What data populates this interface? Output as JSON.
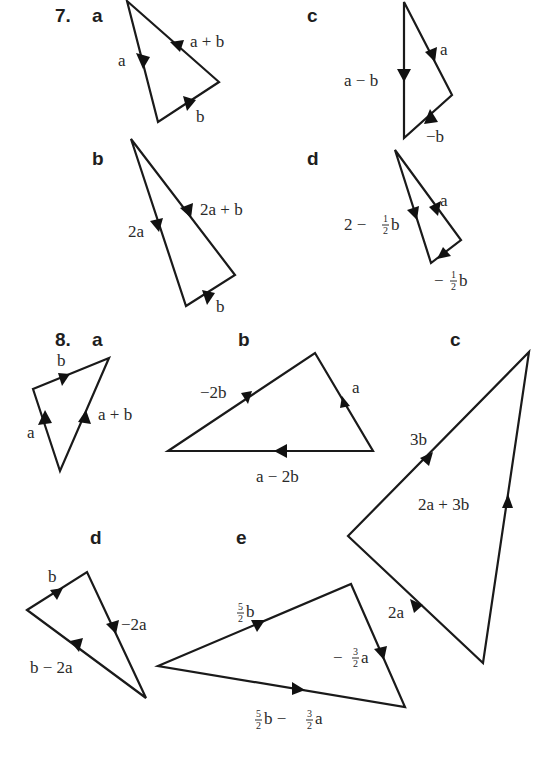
{
  "question7": {
    "number": "7.",
    "parts": {
      "a": {
        "label": "a",
        "edges": [
          "a",
          "a + b",
          "b"
        ]
      },
      "b": {
        "label": "b",
        "edges": [
          "2a",
          "2a + b",
          "b"
        ]
      },
      "c": {
        "label": "c",
        "edges": [
          "a",
          "a − b",
          "−b"
        ]
      },
      "d": {
        "label": "d",
        "edges": [
          "a",
          "2 − ",
          "b",
          "−",
          "b"
        ]
      }
    }
  },
  "question8": {
    "number": "8.",
    "parts": {
      "a": {
        "label": "a",
        "edges": [
          "b",
          "a",
          "a + b"
        ]
      },
      "b": {
        "label": "b",
        "edges": [
          "−2b",
          "a",
          "a − 2b"
        ]
      },
      "c": {
        "label": "c",
        "edges": [
          "3b",
          "2a + 3b",
          "2a"
        ]
      },
      "d": {
        "label": "d",
        "edges": [
          "b",
          "−2a",
          "b − 2a"
        ]
      },
      "e": {
        "label": "e",
        "edges": [
          "b",
          "−",
          "a",
          "b − ",
          "a"
        ]
      }
    }
  },
  "fractions": {
    "half_num": "1",
    "half_den": "2",
    "five_halves_num": "5",
    "five_halves_den": "2",
    "three_halves_num": "3",
    "three_halves_den": "2"
  },
  "colors": {
    "line": "#1a1a1a",
    "text": "#2a2a2a",
    "background": "#ffffff"
  }
}
